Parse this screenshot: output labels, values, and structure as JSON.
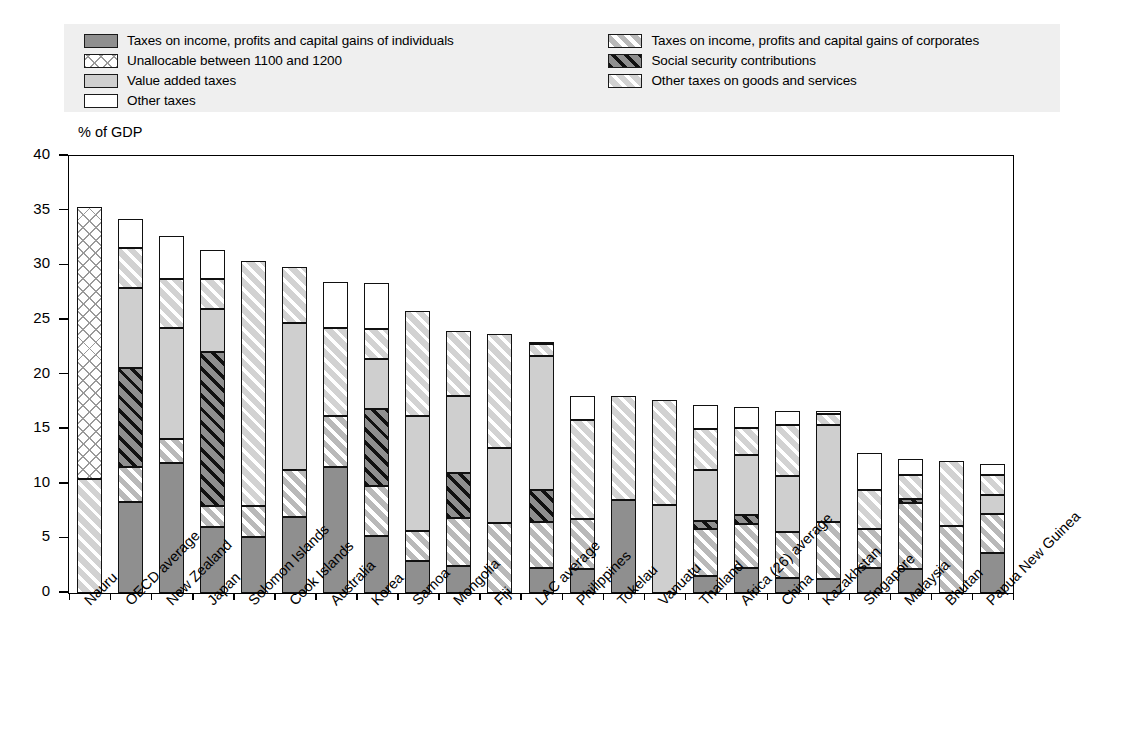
{
  "legend": {
    "left_items": [
      {
        "label": "Taxes on income, profits and capital gains of individuals",
        "pattern": "solid-dark-gray",
        "swatch": "f-ind"
      },
      {
        "label": "Unallocable between 1100 and 1200",
        "pattern": "cross-hatch",
        "swatch": "f-unalloc"
      },
      {
        "label": "Value added taxes",
        "pattern": "solid-light-gray",
        "swatch": "f-vat"
      },
      {
        "label": "Other taxes",
        "pattern": "solid-white",
        "swatch": "f-other"
      }
    ],
    "right_items": [
      {
        "label": "Taxes on income, profits and capital gains of corporates",
        "pattern": "diagonal-white-on-gray",
        "swatch": "f-corp"
      },
      {
        "label": "Social security contributions",
        "pattern": "diagonal-black-on-gray",
        "swatch": "f-ssc"
      },
      {
        "label": "Other taxes on goods and services",
        "pattern": "diagonal-light",
        "swatch": "f-ogs"
      }
    ]
  },
  "axis": {
    "y_title": "% of GDP",
    "y_ticks": [
      "40",
      "35",
      "30",
      "25",
      "20",
      "15",
      "10",
      "5",
      "0"
    ],
    "y_min": 0,
    "y_max": 40
  },
  "chart_data": {
    "type": "bar",
    "stacked": true,
    "title": "",
    "xlabel": "",
    "ylabel": "% of GDP",
    "ylim": [
      0,
      40
    ],
    "grid": false,
    "legend_position": "top",
    "series": [
      {
        "name": "Taxes on income, profits and capital gains of individuals",
        "key": "individuals",
        "fill": "f-ind",
        "values": [
          0.0,
          8.3,
          11.9,
          6.0,
          5.1,
          7.0,
          11.5,
          5.2,
          2.9,
          2.5,
          0.0,
          2.3,
          2.2,
          8.5,
          0.0,
          1.6,
          2.3,
          1.4,
          1.3,
          2.3,
          2.2,
          0.0,
          3.7
        ]
      },
      {
        "name": "Taxes on income, profits and capital gains of corporates",
        "key": "corporates",
        "fill": "f-corp",
        "values": [
          0.0,
          3.2,
          2.2,
          2.0,
          2.9,
          4.3,
          4.7,
          4.6,
          2.8,
          4.4,
          6.4,
          4.2,
          4.6,
          0.0,
          0.0,
          4.3,
          4.0,
          4.2,
          5.2,
          3.6,
          6.0,
          6.1,
          3.5
        ]
      },
      {
        "name": "Social security contributions",
        "key": "social_security",
        "fill": "f-ssc",
        "values": [
          0.0,
          9.1,
          0.0,
          14.1,
          0.0,
          0.0,
          0.0,
          7.0,
          0.0,
          4.1,
          0.0,
          2.9,
          0.0,
          0.0,
          0.0,
          0.7,
          0.8,
          0.0,
          0.0,
          0.0,
          0.4,
          0.0,
          0.0
        ]
      },
      {
        "name": "Value added taxes",
        "key": "vat",
        "fill": "f-vat",
        "values": [
          0.0,
          7.3,
          10.2,
          3.9,
          0.0,
          13.4,
          0.0,
          4.6,
          10.5,
          7.0,
          6.9,
          12.3,
          0.0,
          0.0,
          8.1,
          4.7,
          5.5,
          5.1,
          8.9,
          0.0,
          0.0,
          0.0,
          1.8
        ]
      },
      {
        "name": "Other taxes on goods and services",
        "key": "other_goods_services",
        "fill": "f-ogs",
        "values": [
          10.4,
          3.7,
          4.4,
          2.7,
          22.4,
          5.1,
          8.1,
          2.8,
          9.6,
          6.0,
          10.4,
          1.1,
          9.0,
          9.5,
          9.6,
          3.7,
          2.5,
          4.7,
          1.0,
          3.5,
          2.2,
          6.0,
          1.8
        ]
      },
      {
        "name": "Unallocable between 1100 and 1200",
        "key": "unallocable",
        "fill": "f-unalloc",
        "values": [
          24.9,
          0.0,
          0.0,
          0.0,
          0.0,
          0.0,
          0.0,
          0.0,
          0.0,
          0.0,
          0.0,
          0.0,
          0.0,
          0.0,
          0.0,
          0.0,
          0.0,
          0.0,
          0.0,
          0.0,
          0.0,
          0.0,
          0.0
        ]
      },
      {
        "name": "Other taxes",
        "key": "other_taxes",
        "fill": "f-other",
        "values": [
          0.0,
          2.6,
          4.0,
          2.7,
          0.0,
          0.0,
          4.2,
          4.2,
          0.0,
          0.0,
          0.0,
          0.1,
          2.2,
          0.0,
          0.0,
          2.2,
          1.9,
          1.3,
          0.3,
          3.4,
          1.5,
          0.0,
          1.0
        ]
      }
    ],
    "categories": [
      "Nauru",
      "OECD average",
      "New Zealand",
      "Japan",
      "Solomon Islands",
      "Cook Islands",
      "Australia",
      "Korea",
      "Samoa",
      "Mongolia",
      "Fiji",
      "LAC average",
      "Philippines",
      "Tokelau",
      "Vanuatu",
      "Thailand",
      "Africa (26) average",
      "China",
      "Kazakhstan",
      "Singapore",
      "Malaysia",
      "Bhutan",
      "Papua New Guinea"
    ],
    "totals": [
      35.3,
      34.2,
      32.7,
      31.4,
      30.4,
      29.8,
      28.5,
      28.4,
      25.8,
      24.0,
      23.7,
      22.9,
      18.0,
      18.0,
      17.7,
      17.2,
      17.0,
      16.7,
      16.7,
      12.8,
      12.3,
      12.1,
      11.8
    ]
  },
  "colors": {
    "individuals": "#8f8f8f",
    "vat": "#cfcfcf",
    "corporates": "#b9b9b9",
    "social_security": "#8f8f8f",
    "other_goods_services": "#d2d2d2",
    "other_taxes": "#ffffff",
    "legend_background": "#efefef",
    "outline": "#111111"
  }
}
